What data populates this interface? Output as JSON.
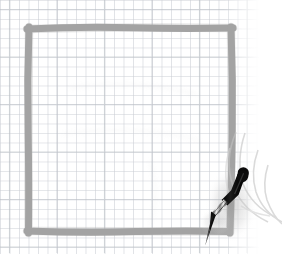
{
  "scene": {
    "title": "Hand-drawn square on graph paper with stylus",
    "width": 282,
    "height": 259,
    "background_color": "#ffffff",
    "description": "A thick gray hand-drawn square outline on light blue-gray graph paper, with a black stylus pen held at the lower-right corner by a faintly sketched hand."
  },
  "paper": {
    "name": "graph-paper",
    "background_color": "#ffffff",
    "grid_line_color": "#c8ccd2",
    "grid_line_color_strong": "#b4b9c0",
    "grid_cell_px": 9.5,
    "grid_line_width_px": 1.1,
    "grid_area": {
      "x": 0,
      "y": 0,
      "width": 259,
      "height": 253
    },
    "margin_right_px": 23,
    "margin_bottom_px": 6
  },
  "drawing": {
    "name": "drawn-square",
    "shape": "square",
    "stroke_color": "#9a9a9a",
    "stroke_color_light": "#a8a8a8",
    "stroke_width_px": 7,
    "bounds": {
      "left": 29,
      "top": 28,
      "right": 231,
      "bottom": 231
    },
    "side_length_px": 202,
    "style": "freehand, slightly wavy, opaque marker",
    "corner_overshoot_px": 3
  },
  "stylus": {
    "name": "stylus-pen",
    "body_color": "#111111",
    "barrel_color": "#2b2b2b",
    "highlight_color": "#e8e8e8",
    "tip_color": "#0d0d0d",
    "angle_degrees": -62,
    "top_point": {
      "x": 247,
      "y": 170
    },
    "tip_point": {
      "x": 205,
      "y": 245
    },
    "length_px": 86,
    "max_width_px": 10,
    "description": "Black pen with rounded cap at upper right, tapering to a fine point at lower left touching the square's bottom-right corner"
  },
  "hand": {
    "name": "hand-outline",
    "stroke_color": "#c3c3c3",
    "stroke_color_faint": "#d6d6d6",
    "stroke_width_px": 1.6,
    "description": "Very faint pencil-sketch contours of fingers and thumb curving around the pen at the right edge",
    "opacity": 0.55
  },
  "shadow": {
    "name": "pen-shadow",
    "color": "#b8b8b8",
    "opacity": 0.35,
    "description": "Soft gray smudge cast beneath the pen onto the paper"
  }
}
